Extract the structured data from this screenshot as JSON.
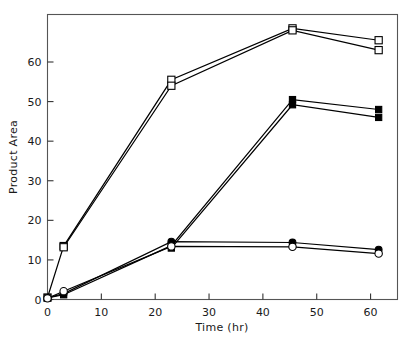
{
  "chart_data": {
    "type": "line",
    "title": "",
    "xlabel": "Time (hr)",
    "ylabel": "Product Area",
    "xlim": [
      0,
      65
    ],
    "ylim": [
      0,
      72
    ],
    "xticks": [
      0,
      10,
      20,
      30,
      40,
      50,
      60
    ],
    "yticks": [
      0,
      10,
      20,
      30,
      40,
      50,
      60
    ],
    "xtick_labels": [
      "0",
      "10",
      "20",
      "30",
      "40",
      "50",
      "60"
    ],
    "ytick_labels": [
      "0",
      "10",
      "20",
      "30",
      "40",
      "50",
      "60"
    ],
    "grid": false,
    "legend": "none",
    "frame": "box",
    "series": [
      {
        "name": "open-square-upper",
        "marker": "open-square",
        "x": [
          0,
          3,
          23,
          45.5,
          61.5
        ],
        "values": [
          0.5,
          13.5,
          55.5,
          68.5,
          65.5
        ]
      },
      {
        "name": "open-square-lower-replicate",
        "marker": "open-square",
        "x": [
          3,
          23,
          45.5,
          61.5
        ],
        "values": [
          13.2,
          54.0,
          68.0,
          63.0
        ]
      },
      {
        "name": "filled-square-upper",
        "marker": "filled-square",
        "x": [
          0,
          3,
          23,
          45.5,
          61.5
        ],
        "values": [
          0.4,
          1.2,
          13.6,
          50.5,
          48.0
        ]
      },
      {
        "name": "filled-square-lower-replicate",
        "marker": "filled-square",
        "x": [
          23,
          45.5,
          61.5
        ],
        "values": [
          13.0,
          49.2,
          46.0
        ]
      },
      {
        "name": "filled-circle",
        "marker": "filled-circle",
        "x": [
          0,
          3,
          23,
          45.5,
          61.5
        ],
        "values": [
          0.4,
          1.5,
          14.6,
          14.4,
          12.6
        ]
      },
      {
        "name": "open-circle",
        "marker": "open-circle",
        "x": [
          0,
          3,
          23,
          45.5,
          61.5
        ],
        "values": [
          0.3,
          2.1,
          13.4,
          13.3,
          11.6
        ]
      }
    ]
  },
  "figure": {
    "background": "#ffffff",
    "line_color": "#000000",
    "frame_color": "#555555",
    "text_color": "#1a1a1a"
  }
}
